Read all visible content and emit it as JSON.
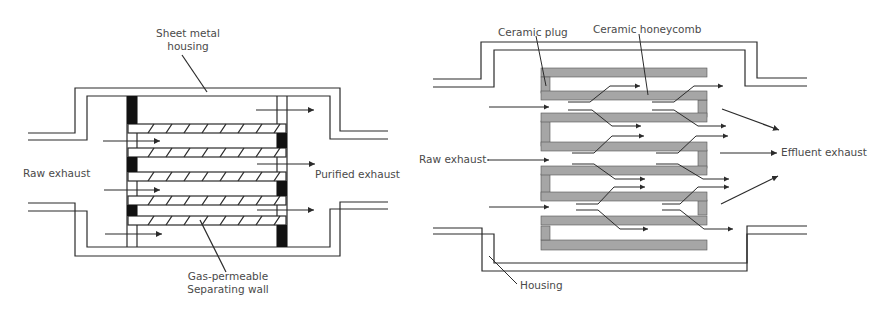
{
  "left_diagram": {
    "title": "Wall-flow filter with gas-permeable separating walls",
    "labels": {
      "housing_line1": "Sheet metal",
      "housing_line2": "housing",
      "inlet": "Raw exhaust",
      "outlet": "Purified exhaust",
      "wall_line1": "Gas-permeable",
      "wall_line2": "Separating wall"
    }
  },
  "right_diagram": {
    "title": "Ceramic honeycomb wall-flow filter",
    "labels": {
      "plug": "Ceramic plug",
      "honeycomb": "Ceramic honeycomb",
      "inlet": "Raw exhaust",
      "outlet": "Effluent exhaust",
      "housing": "Housing"
    }
  },
  "colors": {
    "line": "#2b2b2b",
    "plug_fill": "#111111",
    "ceramic_fill": "#a6a6a6",
    "text": "#4a4a4a"
  }
}
